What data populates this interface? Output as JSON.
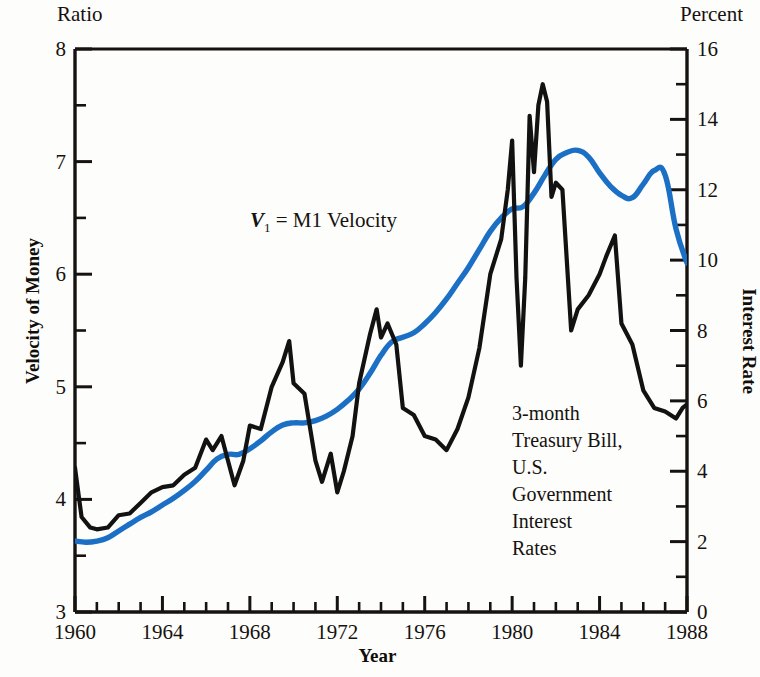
{
  "labels": {
    "left_unit": "Ratio",
    "right_unit": "Percent",
    "y_left_title": "Velocity of Money",
    "y_right_title": "Interest Rate",
    "x_title": "Year"
  },
  "annotations": {
    "velocity": {
      "symbol": "V",
      "subscript": "1",
      "text": " =  M1 Velocity"
    },
    "tbill_lines": [
      "3-month",
      "Treasury Bill,",
      "U.S.",
      "Government",
      "Interest",
      "Rates"
    ]
  },
  "colors": {
    "velocity_line": "#1b6fc4",
    "interest_line": "#121212",
    "axis": "#16120f"
  },
  "chart_data": {
    "type": "line",
    "title": "",
    "xlabel": "Year",
    "ylabel": "Velocity of Money",
    "y2label": "Interest Rate",
    "xlim": [
      1960,
      1988
    ],
    "ylim": [
      3,
      8
    ],
    "y2lim": [
      0,
      16
    ],
    "grid": false,
    "legend": "inline-annotations",
    "x_tick_labels": [
      "1960",
      "1964",
      "1968",
      "1972",
      "1976",
      "1980",
      "1984",
      "1988"
    ],
    "x_ticks_major": [
      1960,
      1964,
      1968,
      1972,
      1976,
      1980,
      1984,
      1988
    ],
    "x_minor_tick_interval": 1,
    "y_left_tick_labels": [
      "3",
      "4",
      "5",
      "6",
      "7",
      "8"
    ],
    "y_left_ticks": [
      3,
      4,
      5,
      6,
      7,
      8
    ],
    "y_left_minor_tick_interval": 0.5,
    "y_right_tick_labels": [
      "0",
      "2",
      "4",
      "6",
      "8",
      "10",
      "12",
      "14",
      "16"
    ],
    "y_right_ticks": [
      0,
      2,
      4,
      6,
      8,
      10,
      12,
      14,
      16
    ],
    "y_right_minor_tick_interval": 1,
    "series": [
      {
        "name": "V1 = M1 Velocity",
        "axis": "left",
        "unit": "ratio",
        "color": "#1b6fc4",
        "x": [
          1960.0,
          1960.5,
          1961.0,
          1961.5,
          1962.0,
          1962.5,
          1963.0,
          1963.5,
          1964.0,
          1964.5,
          1965.0,
          1965.5,
          1966.0,
          1966.5,
          1967.0,
          1967.5,
          1968.0,
          1968.5,
          1969.0,
          1969.5,
          1970.0,
          1970.5,
          1971.0,
          1971.5,
          1972.0,
          1972.5,
          1973.0,
          1973.5,
          1974.0,
          1974.5,
          1975.0,
          1975.5,
          1976.0,
          1976.5,
          1977.0,
          1977.5,
          1978.0,
          1978.5,
          1979.0,
          1979.5,
          1980.0,
          1980.5,
          1981.0,
          1981.5,
          1982.0,
          1982.5,
          1983.0,
          1983.5,
          1984.0,
          1984.5,
          1985.0,
          1985.5,
          1986.0,
          1986.5,
          1987.0,
          1987.5,
          1988.0
        ],
        "y": [
          3.63,
          3.62,
          3.63,
          3.66,
          3.72,
          3.78,
          3.84,
          3.89,
          3.95,
          4.01,
          4.08,
          4.16,
          4.26,
          4.36,
          4.4,
          4.4,
          4.45,
          4.52,
          4.6,
          4.66,
          4.68,
          4.68,
          4.7,
          4.74,
          4.8,
          4.88,
          4.98,
          5.12,
          5.28,
          5.4,
          5.44,
          5.48,
          5.56,
          5.66,
          5.78,
          5.92,
          6.06,
          6.22,
          6.38,
          6.5,
          6.58,
          6.6,
          6.72,
          6.88,
          7.02,
          7.08,
          7.1,
          7.04,
          6.9,
          6.78,
          6.7,
          6.68,
          6.8,
          6.92,
          6.88,
          6.4,
          6.1
        ]
      },
      {
        "name": "3-month Treasury Bill, U.S. Government Interest Rates",
        "axis": "right",
        "unit": "percent",
        "color": "#121212",
        "x": [
          1960.0,
          1960.3,
          1960.7,
          1961.0,
          1961.5,
          1962.0,
          1962.5,
          1963.0,
          1963.5,
          1964.0,
          1964.5,
          1965.0,
          1965.5,
          1966.0,
          1966.3,
          1966.7,
          1967.0,
          1967.3,
          1967.7,
          1968.0,
          1968.5,
          1969.0,
          1969.5,
          1969.8,
          1970.0,
          1970.5,
          1971.0,
          1971.3,
          1971.7,
          1972.0,
          1972.3,
          1972.7,
          1973.0,
          1973.5,
          1973.8,
          1974.0,
          1974.3,
          1974.7,
          1975.0,
          1975.5,
          1976.0,
          1976.5,
          1977.0,
          1977.5,
          1978.0,
          1978.5,
          1979.0,
          1979.5,
          1979.8,
          1980.0,
          1980.2,
          1980.4,
          1980.6,
          1980.8,
          1981.0,
          1981.2,
          1981.4,
          1981.6,
          1981.8,
          1982.0,
          1982.3,
          1982.7,
          1983.0,
          1983.5,
          1984.0,
          1984.3,
          1984.7,
          1985.0,
          1985.5,
          1986.0,
          1986.5,
          1987.0,
          1987.5,
          1987.8,
          1988.0
        ],
        "y": [
          4.1,
          2.7,
          2.4,
          2.35,
          2.4,
          2.75,
          2.8,
          3.1,
          3.4,
          3.55,
          3.6,
          3.9,
          4.1,
          4.9,
          4.6,
          5.0,
          4.3,
          3.6,
          4.3,
          5.3,
          5.2,
          6.4,
          7.1,
          7.7,
          6.5,
          6.2,
          4.3,
          3.7,
          4.5,
          3.4,
          4.0,
          5.0,
          6.5,
          7.9,
          8.6,
          7.8,
          8.2,
          7.6,
          5.8,
          5.6,
          5.0,
          4.9,
          4.6,
          5.2,
          6.1,
          7.5,
          9.6,
          10.6,
          12.0,
          13.4,
          9.5,
          7.0,
          9.5,
          14.1,
          12.5,
          14.4,
          15.0,
          14.5,
          11.8,
          12.2,
          12.0,
          8.0,
          8.6,
          9.0,
          9.6,
          10.1,
          10.7,
          8.2,
          7.6,
          6.3,
          5.8,
          5.7,
          5.5,
          5.8,
          5.9
        ]
      }
    ]
  }
}
